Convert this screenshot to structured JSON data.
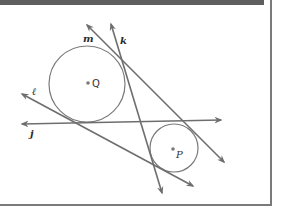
{
  "diagram": {
    "colors": {
      "stroke": "#6e6e6e",
      "frame_bar": "#5f5f5f",
      "border": "#7a7a7a",
      "background": "#ffffff",
      "label": "#2a2a2a"
    },
    "circles": [
      {
        "name": "Q",
        "label": "Q",
        "cx": 87,
        "cy": 84,
        "r": 38
      },
      {
        "name": "P",
        "label": "P",
        "cx": 174,
        "cy": 148,
        "r": 24
      }
    ],
    "lines": [
      {
        "name": "j",
        "label": "j",
        "x1": 22,
        "y1": 124,
        "x2": 221,
        "y2": 120
      },
      {
        "name": "l",
        "label": "ℓ",
        "x1": 22,
        "y1": 94,
        "x2": 193,
        "y2": 186
      },
      {
        "name": "m",
        "label": "m",
        "x1": 87,
        "y1": 25,
        "x2": 224,
        "y2": 162
      },
      {
        "name": "k",
        "label": "k",
        "x1": 111,
        "y1": 24,
        "x2": 162,
        "y2": 193
      }
    ],
    "labels": {
      "m": "m",
      "k": "k",
      "l": "ℓ",
      "j": "j",
      "Q": "Q",
      "P": "P"
    }
  }
}
